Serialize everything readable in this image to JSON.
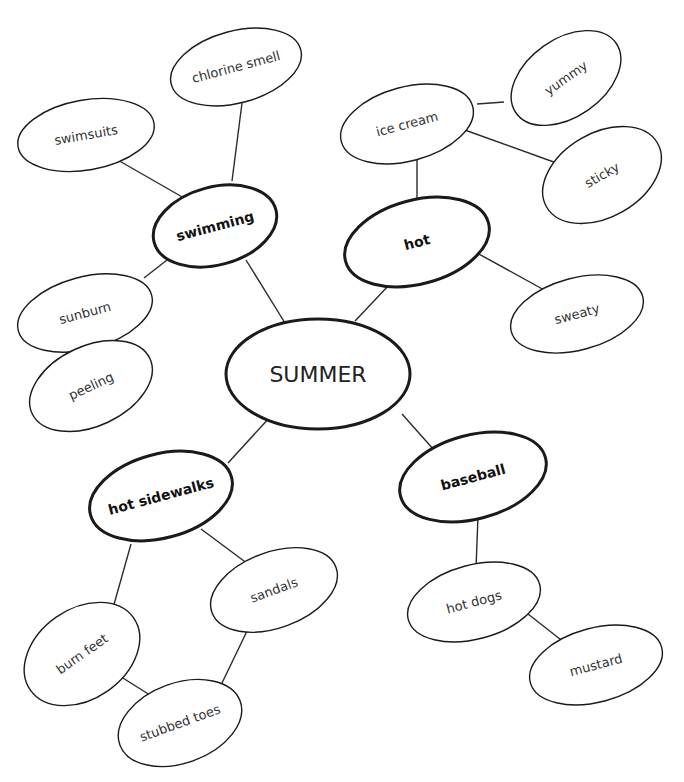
{
  "title": "SUMMER",
  "colors": {
    "background": "#ffffff",
    "stroke": "#1a1a1a",
    "text": "#333333"
  },
  "nodes": [
    {
      "id": "summer",
      "label": "SUMMER",
      "level": 0,
      "cx": 318,
      "cy": 374,
      "rx": 92,
      "ry": 55,
      "rot": 0
    },
    {
      "id": "swimming",
      "label": "swimming",
      "level": 1,
      "cx": 215,
      "cy": 226,
      "rx": 63,
      "ry": 39,
      "rot": -15
    },
    {
      "id": "hot",
      "label": "hot",
      "level": 1,
      "cx": 417,
      "cy": 242,
      "rx": 74,
      "ry": 42,
      "rot": -15
    },
    {
      "id": "hot-sidewalks",
      "label": "hot sidewalks",
      "level": 1,
      "cx": 161,
      "cy": 496,
      "rx": 73,
      "ry": 42,
      "rot": -15
    },
    {
      "id": "baseball",
      "label": "baseball",
      "level": 1,
      "cx": 473,
      "cy": 477,
      "rx": 75,
      "ry": 42,
      "rot": -15
    },
    {
      "id": "chlorine-smell",
      "label": "chlorine smell",
      "level": 2,
      "cx": 236,
      "cy": 67,
      "rx": 67,
      "ry": 36,
      "rot": -15
    },
    {
      "id": "swimsuits",
      "label": "swimsuits",
      "level": 2,
      "cx": 86,
      "cy": 135,
      "rx": 69,
      "ry": 35,
      "rot": -10
    },
    {
      "id": "sunburn",
      "label": "sunburn",
      "level": 2,
      "cx": 85,
      "cy": 313,
      "rx": 69,
      "ry": 36,
      "rot": -15
    },
    {
      "id": "peeling",
      "label": "peeling",
      "level": 2,
      "cx": 91,
      "cy": 386,
      "rx": 65,
      "ry": 40,
      "rot": -25
    },
    {
      "id": "ice-cream",
      "label": "ice cream",
      "level": 2,
      "cx": 407,
      "cy": 124,
      "rx": 68,
      "ry": 37,
      "rot": -15
    },
    {
      "id": "yummy",
      "label": "yummy",
      "level": 2,
      "cx": 566,
      "cy": 78,
      "rx": 61,
      "ry": 39,
      "rot": -35
    },
    {
      "id": "sticky",
      "label": "sticky",
      "level": 2,
      "cx": 602,
      "cy": 175,
      "rx": 64,
      "ry": 42,
      "rot": -30
    },
    {
      "id": "sweaty",
      "label": "sweaty",
      "level": 2,
      "cx": 577,
      "cy": 314,
      "rx": 68,
      "ry": 36,
      "rot": -15
    },
    {
      "id": "sandals",
      "label": "sandals",
      "level": 2,
      "cx": 274,
      "cy": 590,
      "rx": 66,
      "ry": 38,
      "rot": -20
    },
    {
      "id": "burn-feet",
      "label": "burn feet",
      "level": 2,
      "cx": 82,
      "cy": 654,
      "rx": 63,
      "ry": 45,
      "rot": -35
    },
    {
      "id": "stubbed-toes",
      "label": "stubbed toes",
      "level": 2,
      "cx": 180,
      "cy": 723,
      "rx": 64,
      "ry": 40,
      "rot": -20
    },
    {
      "id": "hot-dogs",
      "label": "hot dogs",
      "level": 2,
      "cx": 474,
      "cy": 602,
      "rx": 68,
      "ry": 37,
      "rot": -15
    },
    {
      "id": "mustard",
      "label": "mustard",
      "level": 2,
      "cx": 596,
      "cy": 665,
      "rx": 68,
      "ry": 37,
      "rot": -15
    }
  ],
  "edges": [
    {
      "from": "summer",
      "to": "swimming",
      "x1": 285,
      "y1": 323,
      "x2": 246,
      "y2": 260
    },
    {
      "from": "summer",
      "to": "hot",
      "x1": 355,
      "y1": 321,
      "x2": 390,
      "y2": 284
    },
    {
      "from": "summer",
      "to": "hot-sidewalks",
      "x1": 271,
      "y1": 416,
      "x2": 228,
      "y2": 463
    },
    {
      "from": "summer",
      "to": "baseball",
      "x1": 402,
      "y1": 414,
      "x2": 434,
      "y2": 450
    },
    {
      "from": "swimming",
      "to": "chlorine-smell",
      "x1": 242,
      "y1": 103,
      "x2": 232,
      "y2": 181
    },
    {
      "from": "swimming",
      "to": "swimsuits",
      "x1": 116,
      "y1": 159,
      "x2": 184,
      "y2": 198
    },
    {
      "from": "swimming",
      "to": "sunburn",
      "x1": 167,
      "y1": 260,
      "x2": 144,
      "y2": 278
    },
    {
      "from": "sunburn",
      "to": "peeling",
      "x1": 95,
      "y1": 341,
      "x2": 95,
      "y2": 362
    },
    {
      "from": "hot",
      "to": "ice-cream",
      "x1": 417,
      "y1": 150,
      "x2": 417,
      "y2": 200
    },
    {
      "from": "ice-cream",
      "to": "yummy",
      "x1": 477,
      "y1": 104,
      "x2": 504,
      "y2": 102
    },
    {
      "from": "ice-cream",
      "to": "sticky",
      "x1": 462,
      "y1": 129,
      "x2": 562,
      "y2": 165
    },
    {
      "from": "hot",
      "to": "sweaty",
      "x1": 477,
      "y1": 253,
      "x2": 546,
      "y2": 291
    },
    {
      "from": "hot-sidewalks",
      "to": "sandals",
      "x1": 201,
      "y1": 529,
      "x2": 248,
      "y2": 564
    },
    {
      "from": "hot-sidewalks",
      "to": "burn-feet",
      "x1": 131,
      "y1": 544,
      "x2": 113,
      "y2": 608
    },
    {
      "from": "sandals",
      "to": "stubbed-toes",
      "x1": 248,
      "y1": 629,
      "x2": 222,
      "y2": 683
    },
    {
      "from": "burn-feet",
      "to": "stubbed-toes",
      "x1": 115,
      "y1": 673,
      "x2": 153,
      "y2": 697
    },
    {
      "from": "baseball",
      "to": "hot-dogs",
      "x1": 478,
      "y1": 516,
      "x2": 476,
      "y2": 568
    },
    {
      "from": "hot-dogs",
      "to": "mustard",
      "x1": 528,
      "y1": 614,
      "x2": 565,
      "y2": 643
    }
  ]
}
